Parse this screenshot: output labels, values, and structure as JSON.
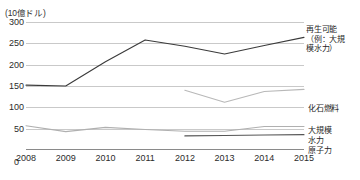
{
  "chart_data": {
    "type": "line",
    "title": "",
    "unit_label": "(10億ドル)",
    "xlabel": "",
    "ylabel": "",
    "x": [
      2008,
      2009,
      2010,
      2011,
      2012,
      2013,
      2014,
      2015
    ],
    "xtick_labels": [
      "2008",
      "2009",
      "2010",
      "2011",
      "2012",
      "2013",
      "2014",
      "2015"
    ],
    "ytick_labels": [
      "300",
      "250",
      "200",
      "150",
      "100",
      "50",
      "0"
    ],
    "ytick_values": [
      300,
      250,
      200,
      150,
      100,
      50,
      0
    ],
    "ylim": [
      0,
      300
    ],
    "grid": true,
    "legend_position": "right-of-plot",
    "series": [
      {
        "name": "再生可能（例：大規模水力）",
        "label_lines": [
          "再生可能",
          "（例：大規模",
          "模水力）"
        ],
        "color": "#3a3a3a",
        "x": [
          2008,
          2009,
          2010,
          2011,
          2012,
          2013,
          2014,
          2015
        ],
        "values": [
          152,
          150,
          207,
          258,
          243,
          225,
          245,
          264
        ]
      },
      {
        "name": "化石燃料",
        "label_lines": [
          "化石燃料"
        ],
        "color": "#b8b8b8",
        "x": [
          2012,
          2013,
          2014,
          2015
        ],
        "values": [
          140,
          112,
          137,
          142
        ]
      },
      {
        "name": "大規模水力",
        "label_lines": [
          "大規模",
          "水力"
        ],
        "color": "#b0b0b0",
        "x": [
          2008,
          2009,
          2010,
          2011,
          2012,
          2013,
          2014,
          2015
        ],
        "values": [
          57,
          43,
          53,
          48,
          44,
          44,
          55,
          55
        ]
      },
      {
        "name": "原子力",
        "label_lines": [
          "原子力"
        ],
        "color": "#555555",
        "x": [
          2012,
          2013,
          2014,
          2015
        ],
        "values": [
          33,
          34,
          35,
          36
        ]
      }
    ]
  },
  "labels": {
    "renewable_l1": "再生可能",
    "renewable_l2": "（例：大規",
    "renewable_l3": "模水力）",
    "fossil": "化石燃料",
    "hydro_l1": "大規模",
    "hydro_l2": "水力",
    "nuclear": "原子力"
  }
}
